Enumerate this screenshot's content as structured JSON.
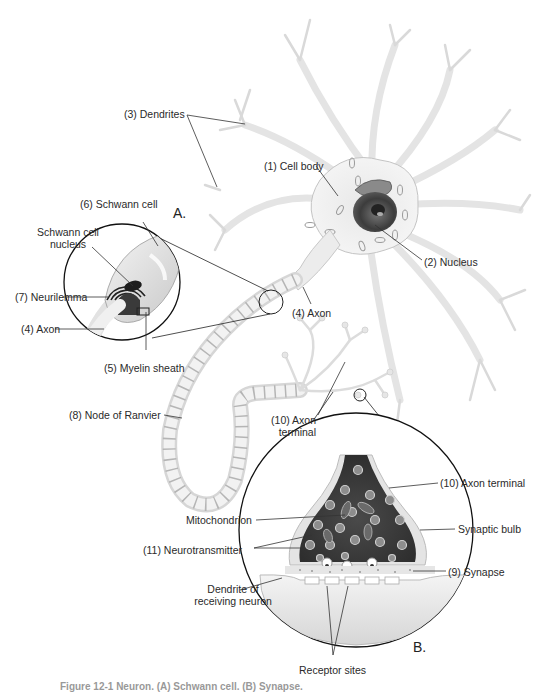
{
  "figure": {
    "insets": {
      "a": {
        "label": "A."
      },
      "b": {
        "label": "B."
      }
    },
    "labels": {
      "dendrites": "(3) Dendrites",
      "cell_body": "(1) Cell body",
      "schwann_cell": "(6) Schwann cell",
      "schwann_cell_nucleus_1": "Schwann cell",
      "schwann_cell_nucleus_2": "nucleus",
      "neurilemma": "(7) Neurilemma",
      "axon_inset": "(4) Axon",
      "myelin_sheath": "(5) Myelin sheath",
      "nucleus": "(2) Nucleus",
      "axon_main": "(4) Axon",
      "node_of_ranvier": "(8) Node of Ranvier",
      "axon_terminal_small_1": "(10) Axon",
      "axon_terminal_small_2": "terminal",
      "axon_terminal_inset": "(10) Axon terminal",
      "mitochondrion": "Mitochondrion",
      "synaptic_bulb": "Synaptic bulb",
      "neurotransmitter": "(11) Neurotransmitter",
      "synapse": "(9) Synapse",
      "dendrite_receiving_1": "Dendrite of",
      "dendrite_receiving_2": "receiving neuron",
      "receptor_sites": "Receptor sites"
    },
    "caption": "Figure 12-1 Neuron. (A) Schwann cell. (B) Synapse."
  },
  "colors": {
    "background": "#ffffff",
    "neuron_fill": "#f1f1f1",
    "neuron_edge": "#c9c9c9",
    "nucleus": "#4a4a4a",
    "terminal_dark": "#3a3a3a",
    "vesicle": "#b8b8b8",
    "leader_line": "#333333"
  }
}
